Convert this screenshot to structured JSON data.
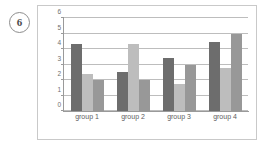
{
  "figure": {
    "marker_label": "6"
  },
  "chart_data": {
    "type": "bar",
    "title": "",
    "xlabel": "",
    "ylabel": "",
    "ylim": [
      0,
      6
    ],
    "yticks": [
      0,
      1,
      2,
      3,
      4,
      5,
      6
    ],
    "ytick_labels": [
      "0",
      "1",
      "2",
      "3",
      "4",
      "5",
      "6"
    ],
    "grid": true,
    "legend": "none",
    "categories": [
      "group 1",
      "group 2",
      "group 3",
      "group 4"
    ],
    "series": [
      {
        "name": "series-1",
        "color": "#6d6d6d",
        "values": [
          4.3,
          2.5,
          3.45,
          4.45
        ]
      },
      {
        "name": "series-2",
        "color": "#bdbdbd",
        "values": [
          2.4,
          4.35,
          1.75,
          2.75
        ]
      },
      {
        "name": "series-3",
        "color": "#989898",
        "values": [
          2.0,
          2.0,
          3.0,
          5.0
        ]
      }
    ]
  }
}
